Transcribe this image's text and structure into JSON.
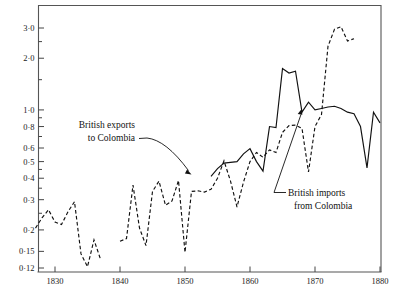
{
  "chart_data": {
    "type": "line",
    "title": "",
    "subtitle": "",
    "xlabel": "",
    "ylabel": "",
    "yscale": "log",
    "ylim": [
      0.115,
      3.6
    ],
    "xlim": [
      1827,
      1880
    ],
    "grid": false,
    "legend_position": "inline-annotations",
    "ytick_labels": [
      "3·0",
      "2·0",
      "1·0",
      "0·8",
      "0·6",
      "0·5",
      "0·4",
      "0·3",
      "0·2",
      "0·15",
      "0·12"
    ],
    "ytick_values": [
      3.0,
      2.0,
      1.0,
      0.8,
      0.6,
      0.5,
      0.4,
      0.3,
      0.2,
      0.15,
      0.12
    ],
    "yminor_values": [
      0.9,
      0.7,
      0.25,
      0.35,
      0.45,
      1.5,
      2.5
    ],
    "xtick_labels": [
      "1830",
      "1840",
      "1850",
      "1860",
      "1870",
      "1880"
    ],
    "xtick_values": [
      1830,
      1840,
      1850,
      1860,
      1870,
      1880
    ],
    "series": [
      {
        "name": "British exports to Colombia",
        "style": "dashed",
        "x": [
          1827,
          1828,
          1829,
          1830,
          1831,
          1832,
          1833,
          1834,
          1835,
          1836,
          1837,
          1840,
          1841,
          1842,
          1843,
          1844,
          1845,
          1846,
          1847,
          1848,
          1849,
          1850,
          1851,
          1852,
          1853,
          1854,
          1855,
          1856,
          1857,
          1858,
          1859,
          1860,
          1861,
          1862,
          1863,
          1864,
          1865,
          1866,
          1867,
          1868,
          1869,
          1870,
          1871,
          1872,
          1873,
          1874,
          1875,
          1876
        ],
        "values": [
          0.205,
          0.235,
          0.262,
          0.222,
          0.215,
          0.255,
          0.292,
          0.145,
          0.122,
          0.175,
          0.135,
          0.172,
          0.178,
          0.365,
          0.205,
          0.162,
          0.335,
          0.385,
          0.278,
          0.295,
          0.388,
          0.148,
          0.335,
          0.338,
          0.332,
          0.345,
          0.4,
          0.505,
          0.385,
          0.272,
          0.38,
          0.5,
          0.565,
          0.53,
          0.585,
          0.565,
          0.74,
          0.81,
          0.815,
          0.78,
          0.435,
          0.8,
          0.94,
          2.35,
          2.95,
          3.05,
          2.52,
          2.6
        ],
        "x_note": "dashed series has gaps: 1837-1840 break"
      },
      {
        "name": "British imports from Colombia",
        "style": "solid",
        "x": [
          1854,
          1855,
          1856,
          1857,
          1858,
          1859,
          1860,
          1861,
          1862,
          1863,
          1864,
          1865,
          1866,
          1867,
          1868,
          1869,
          1870,
          1871,
          1872,
          1873,
          1874,
          1875,
          1876,
          1877,
          1878,
          1879,
          1880
        ],
        "values": [
          0.41,
          0.455,
          0.49,
          0.495,
          0.5,
          0.555,
          0.595,
          0.5,
          0.44,
          0.8,
          0.79,
          1.74,
          1.64,
          1.68,
          0.97,
          1.11,
          1.0,
          1.02,
          1.04,
          1.05,
          1.02,
          0.97,
          0.95,
          0.8,
          0.46,
          0.97,
          0.84
        ]
      }
    ],
    "annotations": [
      {
        "id": "exports-label",
        "line1": "British exports",
        "line2": "to Colombia",
        "points_to": {
          "x": 1851,
          "y": 0.42
        }
      },
      {
        "id": "imports-label",
        "line1": "British imports",
        "line2": "from Colombia",
        "points_to": {
          "x": 1868,
          "y": 1.02
        }
      }
    ]
  }
}
